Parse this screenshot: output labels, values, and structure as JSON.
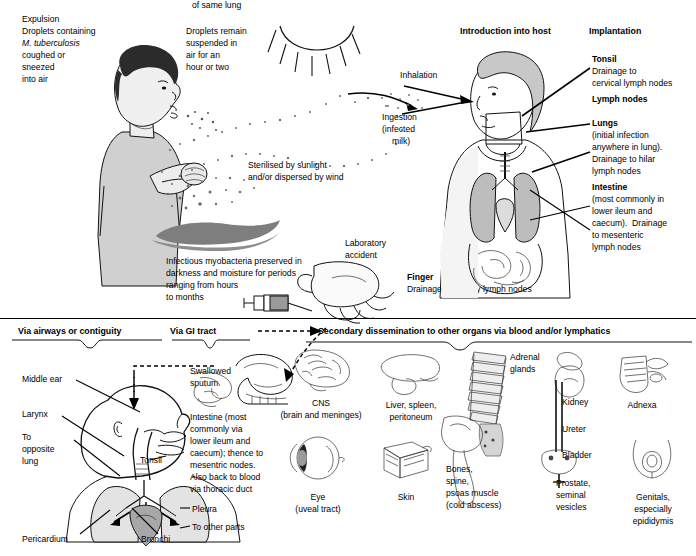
{
  "diagram": {
    "top_left": {
      "heading": "Expulsion",
      "body_line1": "Droplets containing",
      "body_italic": "M. tuberculosis",
      "body_line3": "coughed or",
      "body_line4": "sneezed",
      "body_line5": "into air"
    },
    "suspended": {
      "line1": "Droplets remain",
      "line2": "suspended in",
      "line3": "air for an",
      "line4": "hour or two"
    },
    "sterilised": {
      "line1": "Sterilised by sunlight",
      "line2": "and/or dispersed by wind"
    },
    "preserved": {
      "line1": "Infectious myobacteria preserved in",
      "line2": "darkness and moisture for periods",
      "line3": "ranging from hours",
      "line4": "to months"
    },
    "laboratory": {
      "line1": "Laboratory",
      "line2": "accident"
    },
    "finger": {
      "heading": "Finger",
      "body": "Drainage to axillary lymph nodes"
    },
    "introduction": {
      "heading": "Introduction into host",
      "inhalation": "Inhalation",
      "ingestion_line1": "Ingestion",
      "ingestion_line2": "(infected",
      "ingestion_line3": "milk)"
    },
    "implantation": {
      "heading": "Implantation",
      "items": [
        {
          "label": "Tonsil",
          "detail": [
            "Drainage to",
            "cervical lymph nodes"
          ]
        },
        {
          "label": "Lymph nodes",
          "detail": []
        },
        {
          "label": "Lungs",
          "detail": [
            "(initial infection",
            "anywhere in lung).",
            "Drainage to hilar",
            "lymph nodes"
          ]
        },
        {
          "label": "Intestine",
          "detail": [
            "(most commonly in",
            "lower ileum and",
            "caecum).  Drainage",
            "to mesenteric",
            "lymph nodes"
          ]
        }
      ]
    },
    "bottom": {
      "bracket1": "Via airways or contiguity",
      "bracket2": "Via GI tract",
      "bracket3": "Secondary dissemination to other organs via blood and/or lymphatics",
      "airways_labels": {
        "middle_ear": "Middle ear",
        "larynx": "Larynx",
        "opposite_lung": [
          "To",
          "opposite",
          "lung"
        ],
        "tonsil": "Tonsil",
        "pericardium": "Pericardium",
        "bronchi": "Bronchi"
      },
      "gi": {
        "swallowed": [
          "Swallowed",
          "sputum"
        ],
        "intestine": [
          "Intestine (most",
          "commonly via",
          "lower ileum and",
          "caecum); thence to",
          "mesentric nodes.",
          "Also back to blood",
          "via thoracic duct"
        ],
        "pleura": "Pleura",
        "other_parts": [
          "To other parts",
          "of same lung"
        ]
      },
      "organs": [
        {
          "name": "cns",
          "caption": [
            "CNS",
            "(brain and meninges)"
          ]
        },
        {
          "name": "liver-spleen-peritoneum",
          "caption": [
            "Liver, spleen,",
            "peritoneum"
          ]
        },
        {
          "name": "adrenal-glands",
          "caption": [
            "Adrenal",
            "glands"
          ]
        },
        {
          "name": "kidney",
          "caption": [
            "Kidney"
          ]
        },
        {
          "name": "ureter",
          "caption": [
            "Ureter"
          ]
        },
        {
          "name": "bladder",
          "caption": [
            "Bladder"
          ]
        },
        {
          "name": "adnexa",
          "caption": [
            "Adnexa"
          ]
        },
        {
          "name": "eye",
          "caption": [
            "Eye",
            "(uveal tract)"
          ]
        },
        {
          "name": "skin",
          "caption": [
            "Skin"
          ]
        },
        {
          "name": "bones-spine",
          "caption": [
            "Bones,",
            "spine,",
            "psoas muscle",
            "(cold abscess)"
          ]
        },
        {
          "name": "prostate",
          "caption": [
            "Prostate,",
            "seminal",
            "vesicles"
          ]
        },
        {
          "name": "genitals",
          "caption": [
            "Genitals,",
            "especially",
            "epididymis"
          ]
        }
      ]
    },
    "colors": {
      "ink": "#111111",
      "mid_gray": "#bdbdbd",
      "light_gray": "#e4e4e4",
      "dark_gray": "#8a8a8a",
      "background": "#ffffff"
    }
  }
}
